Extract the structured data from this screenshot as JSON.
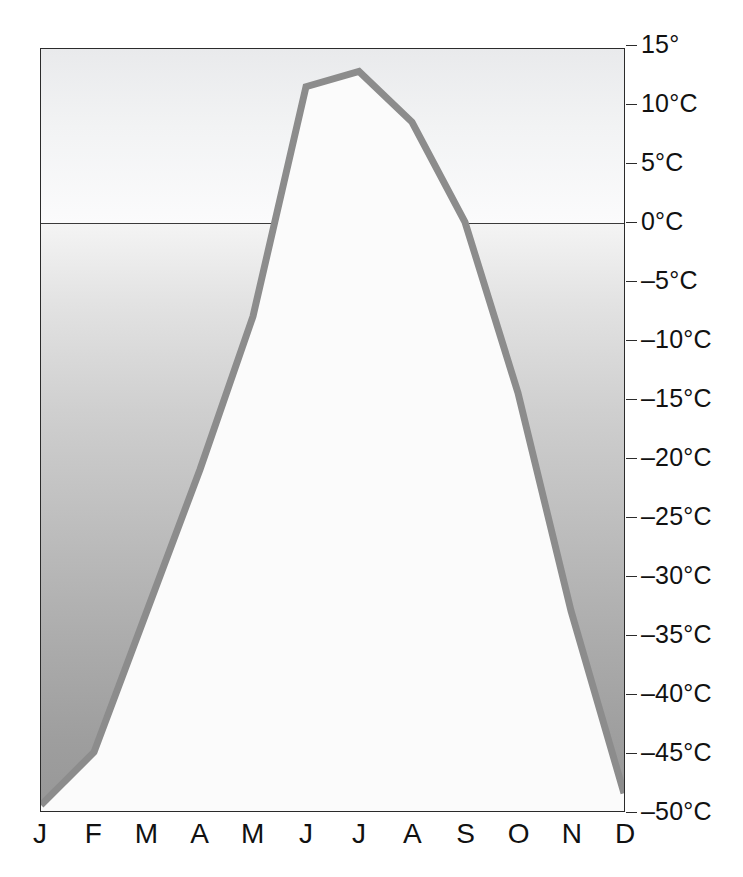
{
  "chart_data": {
    "type": "line",
    "title": "",
    "subtitle": "",
    "xlabel": "",
    "ylabel": "",
    "categories": [
      "J",
      "F",
      "M",
      "A",
      "M",
      "J",
      "J",
      "A",
      "S",
      "O",
      "N",
      "D"
    ],
    "month_names": [
      "January",
      "February",
      "March",
      "April",
      "May",
      "June",
      "July",
      "August",
      "September",
      "October",
      "November",
      "December"
    ],
    "series": [
      {
        "name": "Monthly mean temperature",
        "unit": "°C",
        "values": [
          -49.5,
          -45.0,
          -33.0,
          -21.0,
          -8.0,
          11.5,
          12.8,
          8.5,
          0.0,
          -14.5,
          -33.0,
          -48.5
        ]
      }
    ],
    "ylim": [
      -50,
      14.7
    ],
    "xlim": [
      0,
      11
    ],
    "yticks": [
      15,
      10,
      5,
      0,
      -5,
      -10,
      -15,
      -20,
      -25,
      -30,
      -35,
      -40,
      -45,
      -50
    ],
    "ytick_labels": [
      "15°",
      "10°C",
      "5°C",
      "0°C",
      "–5°C",
      "–10°C",
      "–15°C",
      "–20°C",
      "–25°C",
      "–30°C",
      "–35°C",
      "–40°C",
      "–45°C",
      "–50°C"
    ],
    "grid": false,
    "legend": "none",
    "freezing_line_value": 0,
    "line_color": "#8c8c8c",
    "below_curve_fill": "#fbfbfb",
    "above_freezing_band_color": "#eff0f1",
    "below_freezing_band_top_color": "#f4f4f4",
    "below_freezing_band_bottom_color": "#979797",
    "axis_color": "#2b2b2b",
    "text_color": "#111111"
  }
}
